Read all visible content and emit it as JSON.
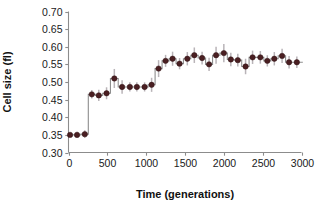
{
  "figure": {
    "background_color": "#ffffff",
    "marker_color": "#4a1f22",
    "errorbar_color": "#b9b4b8",
    "line_color": "#8e8e8e",
    "axis_color": "#8c8c8c"
  },
  "axes": {
    "y_title": "Cell size (fl)",
    "x_title": "Time (generations)",
    "y_ticks": [
      "0.70",
      "0.65",
      "0.60",
      "0.55",
      "0.50",
      "0.45",
      "0.40",
      "0.35",
      "0.30"
    ],
    "x_ticks": [
      "0",
      "500",
      "1000",
      "1500",
      "2000",
      "2500",
      "3000"
    ]
  },
  "chart_data": {
    "type": "scatter",
    "title": "",
    "subtitle": "",
    "xlabel": "Time (generations)",
    "ylabel": "Cell size (fl)",
    "xlim": [
      0,
      3000
    ],
    "ylim": [
      0.3,
      0.7
    ],
    "xticks": [
      0,
      500,
      1000,
      1500,
      2000,
      2500,
      3000
    ],
    "yticks": [
      0.3,
      0.35,
      0.4,
      0.45,
      0.5,
      0.55,
      0.6,
      0.65,
      0.7
    ],
    "grid": false,
    "legend": "none",
    "step_line": true,
    "marker_style": "filled-circle",
    "errorbars": "vertical",
    "series": [
      {
        "name": "Cell size",
        "x": [
          20,
          110,
          210,
          300,
          390,
          490,
          590,
          690,
          790,
          880,
          980,
          1070,
          1160,
          1250,
          1340,
          1430,
          1530,
          1620,
          1720,
          1810,
          1900,
          2000,
          2090,
          2180,
          2280,
          2370,
          2470,
          2560,
          2650,
          2750,
          2840,
          2940
        ],
        "y": [
          0.35,
          0.35,
          0.352,
          0.465,
          0.462,
          0.468,
          0.51,
          0.486,
          0.486,
          0.486,
          0.486,
          0.492,
          0.538,
          0.56,
          0.566,
          0.552,
          0.566,
          0.576,
          0.568,
          0.55,
          0.576,
          0.582,
          0.564,
          0.562,
          0.544,
          0.57,
          0.57,
          0.56,
          0.566,
          0.574,
          0.556,
          0.556
        ],
        "yerr": [
          0.006,
          0.009,
          0.011,
          0.012,
          0.016,
          0.017,
          0.027,
          0.019,
          0.013,
          0.013,
          0.013,
          0.02,
          0.024,
          0.017,
          0.02,
          0.016,
          0.019,
          0.022,
          0.018,
          0.019,
          0.024,
          0.026,
          0.019,
          0.018,
          0.022,
          0.019,
          0.018,
          0.016,
          0.019,
          0.02,
          0.018,
          0.016
        ]
      }
    ]
  }
}
